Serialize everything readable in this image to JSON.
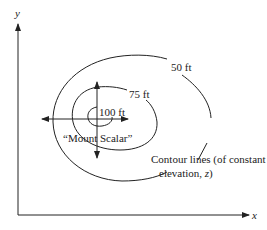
{
  "axes": {
    "x_label": "x",
    "y_label": "y"
  },
  "contours": [
    {
      "label": "50 ft",
      "elevation": 50
    },
    {
      "label": "75 ft",
      "elevation": 75
    },
    {
      "label": "100 ft",
      "elevation": 100
    }
  ],
  "peak_label": "“Mount Scalar”",
  "annotation": {
    "line1": "Contour lines (of constant",
    "line2_prefix": "elevation, ",
    "line2_var": "z",
    "line2_suffix": ")"
  },
  "colors": {
    "ink": "#222222",
    "background": "#ffffff"
  }
}
